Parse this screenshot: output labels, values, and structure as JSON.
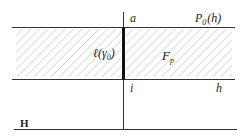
{
  "diagram": {
    "labels": {
      "a": "a",
      "P0h_main": "P",
      "P0h_sub": "0",
      "P0h_arg": "(h)",
      "ell": "ℓ(γ",
      "ell_sub": "0",
      "ell_close": ")",
      "F_main": "F",
      "F_sub": "p",
      "i": "i",
      "h": "h",
      "H": "H"
    },
    "colors": {
      "line": "#333333",
      "hatch": "#b8b8b8",
      "background": "#ffffff"
    }
  }
}
